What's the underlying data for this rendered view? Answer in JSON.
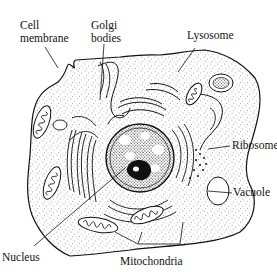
{
  "diagram": {
    "style": "black ink line drawing with stippled cytoplasm",
    "colors": {
      "ink": "#111111",
      "background": "#ffffff"
    },
    "labels": {
      "cell_membrane_line1": "Cell",
      "cell_membrane_line2": "membrane",
      "golgi_line1": "Golgi",
      "golgi_line2": "bodies",
      "lysosome": "Lysosome",
      "ribosome": "Ribosome",
      "vacuole": "Vacuole",
      "nucleus": "Nucleus",
      "mitochondria": "Mitochondria"
    }
  }
}
